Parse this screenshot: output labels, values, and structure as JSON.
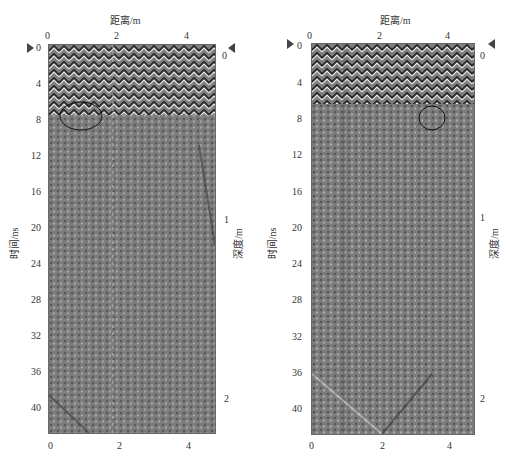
{
  "figure": {
    "panels": [
      {
        "id": "left",
        "top_axis": {
          "label": "距离/m",
          "ticks": [
            "0",
            "2",
            "4"
          ]
        },
        "bottom_axis": {
          "ticks": [
            "0",
            "2",
            "4"
          ]
        },
        "left_axis": {
          "label": "时间/ns",
          "ticks": [
            "0",
            "4",
            "8",
            "12",
            "16",
            "20",
            "24",
            "28",
            "32",
            "36",
            "40"
          ]
        },
        "right_axis": {
          "label": "深度/m",
          "ticks": [
            "0",
            "1",
            "2"
          ]
        },
        "annotation": {
          "type": "ellipse",
          "center_distance_m": 1.2,
          "center_time_ns": 8.5
        }
      },
      {
        "id": "right",
        "top_axis": {
          "label": "距离/m",
          "ticks": [
            "0",
            "2",
            "4"
          ]
        },
        "bottom_axis": {
          "ticks": [
            "0",
            "2",
            "4"
          ]
        },
        "left_axis": {
          "label": "时间/ns",
          "ticks": [
            "0",
            "4",
            "8",
            "12",
            "16",
            "20",
            "24",
            "28",
            "32",
            "36",
            "40"
          ]
        },
        "right_axis": {
          "label": "深度/m",
          "ticks": [
            "0",
            "1",
            "2"
          ]
        },
        "annotation": {
          "type": "ellipse",
          "center_distance_m": 2.6,
          "center_time_ns": 8.0
        }
      }
    ]
  },
  "colors": {
    "background": "#ffffff",
    "radar_gray": "#7a7a7a",
    "axis": "#555555"
  }
}
